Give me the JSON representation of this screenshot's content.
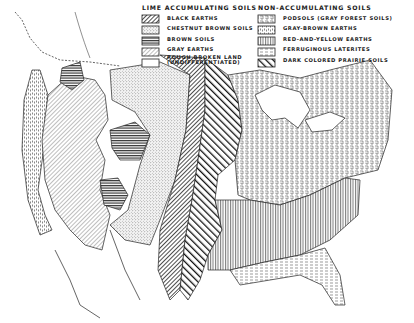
{
  "legend": {
    "lime": {
      "header": "LIME ACCUMULATING SOILS",
      "items": [
        {
          "label": "BLACK EARTHS",
          "pattern": "diag-dense"
        },
        {
          "label": "CHESTNUT BROWN SOILS",
          "pattern": "stipple"
        },
        {
          "label": "BROWN SOILS",
          "pattern": "horiz"
        },
        {
          "label": "GRAY EARTHS",
          "pattern": "diag-light"
        },
        {
          "label": "ROUGH BROKEN LAND",
          "label2": "(UNDIFFERENTIATED)",
          "pattern": "blank"
        }
      ]
    },
    "non": {
      "header": "NON-ACCUMULATING SOILS",
      "items": [
        {
          "label": "PODSOLS (GRAY FOREST SOILS)",
          "pattern": "fret"
        },
        {
          "label": "GRAY-BROWN EARTHS",
          "pattern": "fret-dash"
        },
        {
          "label": "RED-AND-YELLOW EARTHS",
          "pattern": "vert"
        },
        {
          "label": "FERRUGINOUS LATERITES",
          "pattern": "dash-horiz"
        },
        {
          "label": "DARK COLORED PRAIRIE SOILS",
          "pattern": "diag-bold"
        }
      ]
    }
  },
  "colors": {
    "ink": "#1e1e1e",
    "paper": "#ffffff"
  }
}
